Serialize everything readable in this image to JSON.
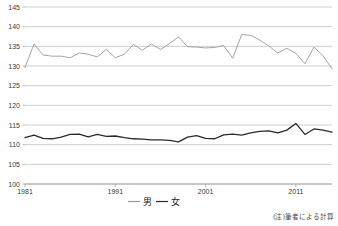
{
  "note": "(注)筆者による計算",
  "legend": {
    "male": "男",
    "female": "女"
  },
  "axis": {
    "y_ticks": [
      "100",
      "105",
      "110",
      "115",
      "120",
      "125",
      "130",
      "135",
      "140",
      "145"
    ],
    "x_ticks": [
      "1981",
      "1991",
      "2001",
      "2011"
    ]
  },
  "chart_data": {
    "type": "line",
    "title": "",
    "xlabel": "",
    "ylabel": "",
    "ylim": [
      100,
      145
    ],
    "xlim": [
      1981,
      2015
    ],
    "grid": true,
    "legend_position": "bottom",
    "x": [
      1981,
      1982,
      1983,
      1984,
      1985,
      1986,
      1987,
      1988,
      1989,
      1990,
      1991,
      1992,
      1993,
      1994,
      1995,
      1996,
      1997,
      1998,
      1999,
      2000,
      2001,
      2002,
      2003,
      2004,
      2005,
      2006,
      2007,
      2008,
      2009,
      2010,
      2011,
      2012,
      2013,
      2014,
      2015
    ],
    "series": [
      {
        "name": "男",
        "color": "#9a9a9a",
        "values": [
          129.6,
          135.6,
          132.8,
          132.5,
          132.5,
          132.1,
          133.3,
          133.0,
          132.3,
          134.2,
          132.1,
          133.0,
          135.5,
          134.0,
          135.6,
          134.2,
          135.7,
          137.4,
          134.9,
          134.8,
          134.6,
          134.7,
          135.2,
          132.0,
          138.0,
          137.8,
          136.6,
          135.1,
          133.3,
          134.5,
          133.2,
          130.6,
          134.8,
          132.6,
          129.3
        ]
      },
      {
        "name": "女",
        "color": "#2a2a2a",
        "values": [
          111.8,
          112.4,
          111.6,
          111.5,
          111.9,
          112.6,
          112.7,
          112.0,
          112.6,
          112.1,
          112.2,
          111.8,
          111.5,
          111.4,
          111.2,
          111.2,
          111.1,
          110.7,
          111.9,
          112.3,
          111.6,
          111.5,
          112.5,
          112.7,
          112.4,
          113.0,
          113.4,
          113.5,
          113.0,
          113.7,
          115.4,
          112.6,
          114.0,
          113.7,
          113.2
        ]
      }
    ]
  }
}
